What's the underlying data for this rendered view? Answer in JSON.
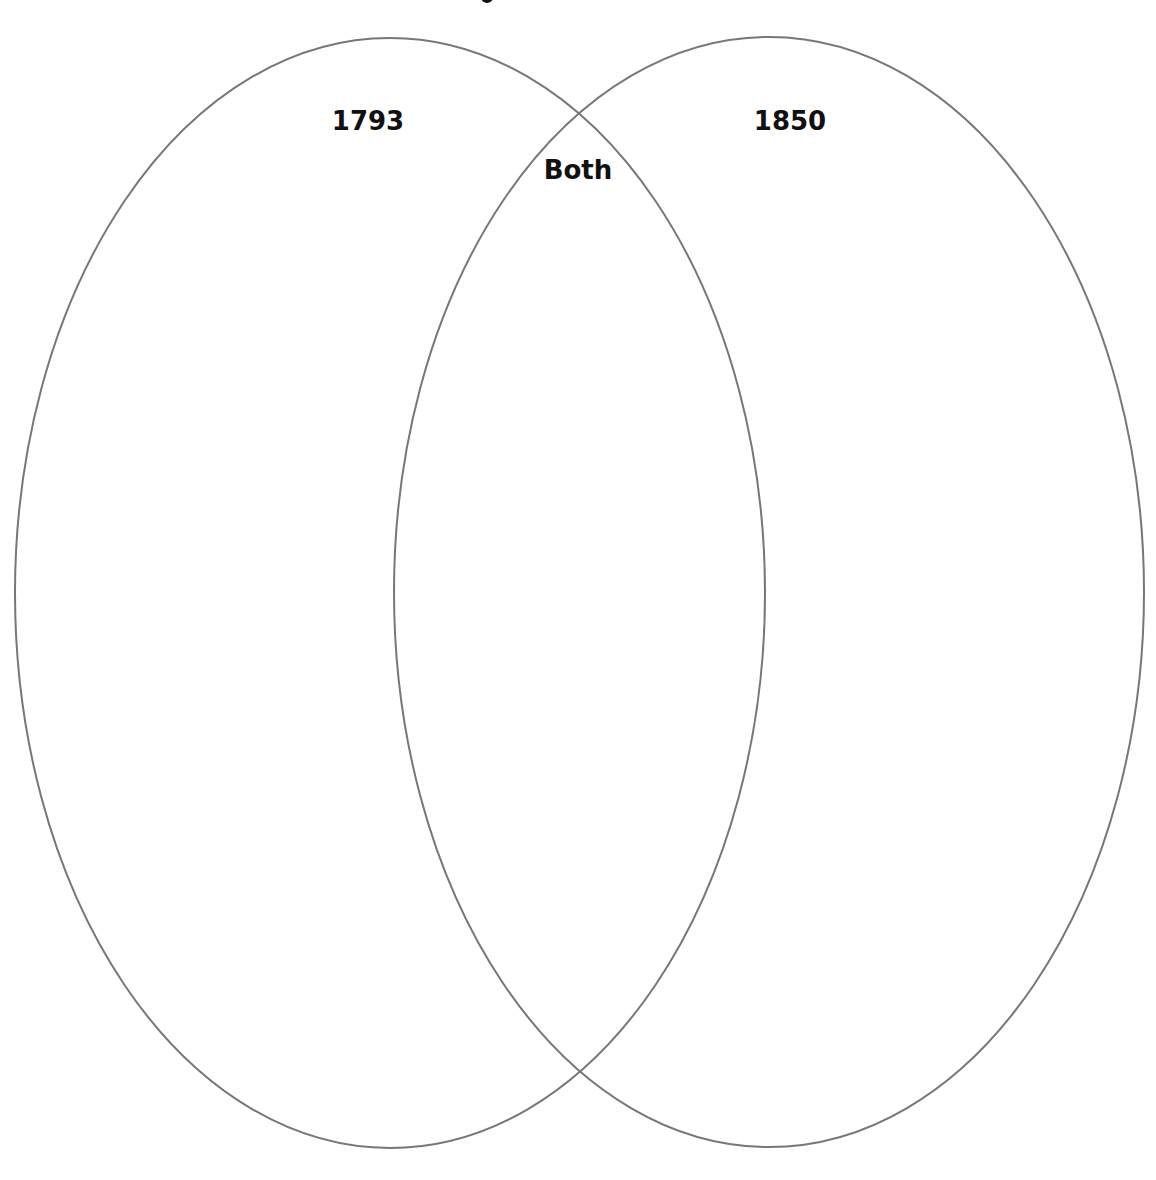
{
  "diagram": {
    "type": "venn",
    "title_fragment": ".",
    "stroke_color": "#777777",
    "sets": [
      {
        "label": "1793",
        "cx": 390,
        "cy": 593,
        "rx": 375,
        "ry": 555,
        "label_x": 368,
        "label_y": 106
      },
      {
        "label": "1850",
        "cx": 769,
        "cy": 592,
        "rx": 375,
        "ry": 555,
        "label_x": 790,
        "label_y": 106
      }
    ],
    "intersection": {
      "label": "Both",
      "label_x": 578,
      "label_y": 155
    }
  }
}
